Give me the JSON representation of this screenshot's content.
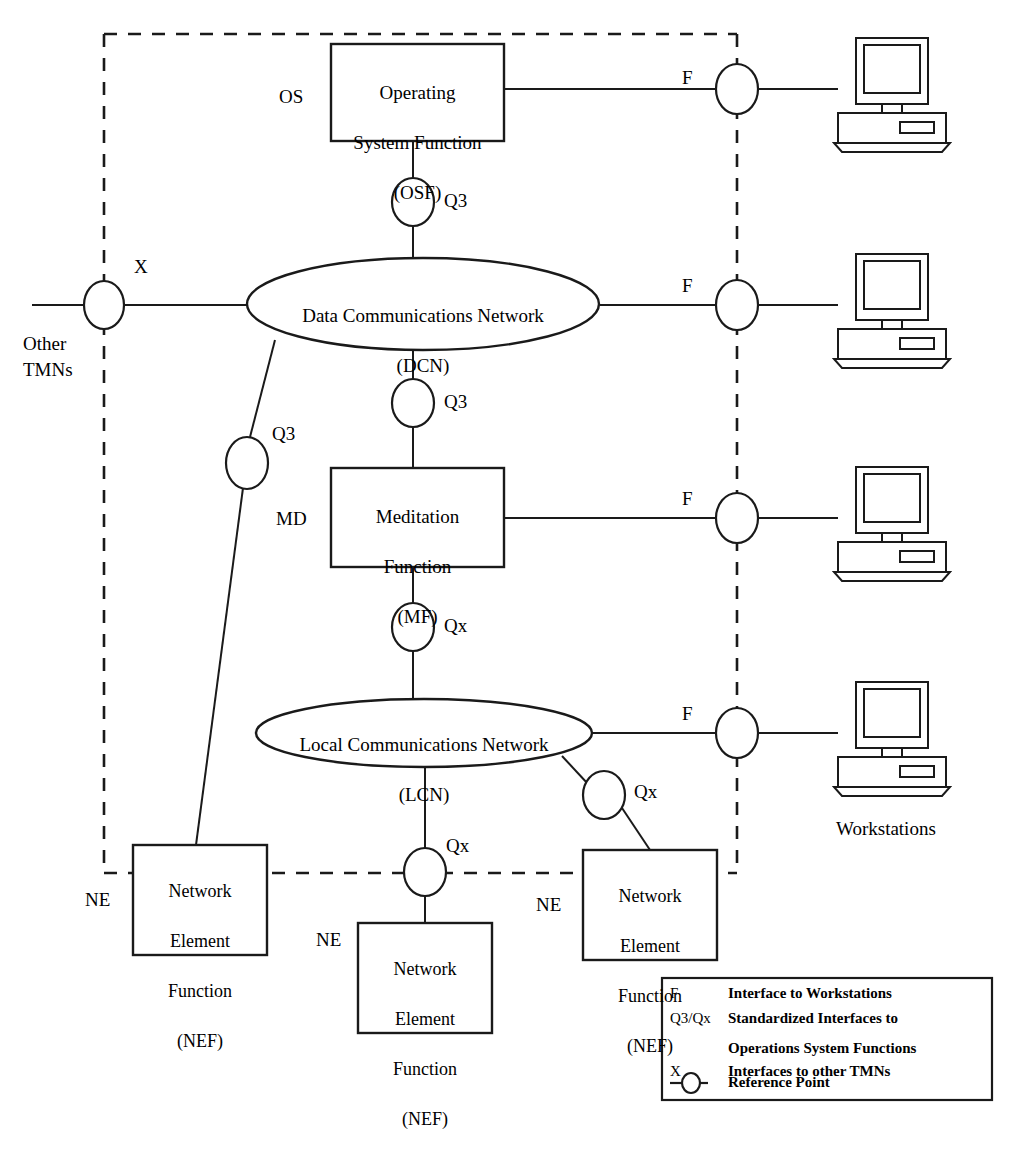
{
  "diagram": {
    "stroke_color": "#1a1a1a",
    "background_color": "#ffffff",
    "boundary_style": "dashed"
  },
  "nodes": {
    "osf": {
      "line1": "Operating",
      "line2": "System Function",
      "line3": "(OSF)",
      "tag": "OS"
    },
    "dcn": {
      "line1": "Data Communications Network",
      "line2": "(DCN)"
    },
    "mf": {
      "line1": "Meditation",
      "line2": "Function",
      "line3": "(MF)",
      "tag": "MD"
    },
    "lcn": {
      "line1": "Local Communications Network",
      "line2": "(LCN)"
    },
    "nef_left": {
      "line1": "Network",
      "line2": "Element",
      "line3": "Function",
      "line4": "(NEF)",
      "tag": "NE"
    },
    "nef_center": {
      "line1": "Network",
      "line2": "Element",
      "line3": "Function",
      "line4": "(NEF)",
      "tag": "NE"
    },
    "nef_right": {
      "line1": "Network",
      "line2": "Element",
      "line3": "Function",
      "line4": "(NEF)",
      "tag": "NE"
    },
    "other_tmns": {
      "label": "Other\nTMNs"
    },
    "workstations_caption": {
      "label": "Workstations"
    }
  },
  "reference_points": [
    {
      "id": "rp-f-osf",
      "label": "F"
    },
    {
      "id": "rp-f-dcn",
      "label": "F"
    },
    {
      "id": "rp-f-mf",
      "label": "F"
    },
    {
      "id": "rp-f-lcn",
      "label": "F"
    },
    {
      "id": "rp-x-other-tmns",
      "label": "X"
    },
    {
      "id": "rp-q3-osf-dcn",
      "label": "Q3"
    },
    {
      "id": "rp-q3-dcn-mf",
      "label": "Q3"
    },
    {
      "id": "rp-q3-dcn-nef",
      "label": "Q3"
    },
    {
      "id": "rp-qx-mf-lcn",
      "label": "Qx"
    },
    {
      "id": "rp-qx-lcn-nef-right",
      "label": "Qx"
    },
    {
      "id": "rp-qx-lcn-nef-center",
      "label": "Qx"
    }
  ],
  "legend": {
    "rows": [
      {
        "key": "F",
        "desc": "Interface to Workstations"
      },
      {
        "key": "Q3/Qx",
        "desc": "Standardized Interfaces to"
      },
      {
        "key": "",
        "desc": "Operations System Functions"
      },
      {
        "key": "X",
        "desc": "Interfaces to other TMNs"
      },
      {
        "key": "reference-point-symbol",
        "desc": "Reference Point"
      }
    ]
  },
  "workstations": [
    {
      "id": "workstation-1"
    },
    {
      "id": "workstation-2"
    },
    {
      "id": "workstation-3"
    },
    {
      "id": "workstation-4"
    }
  ]
}
